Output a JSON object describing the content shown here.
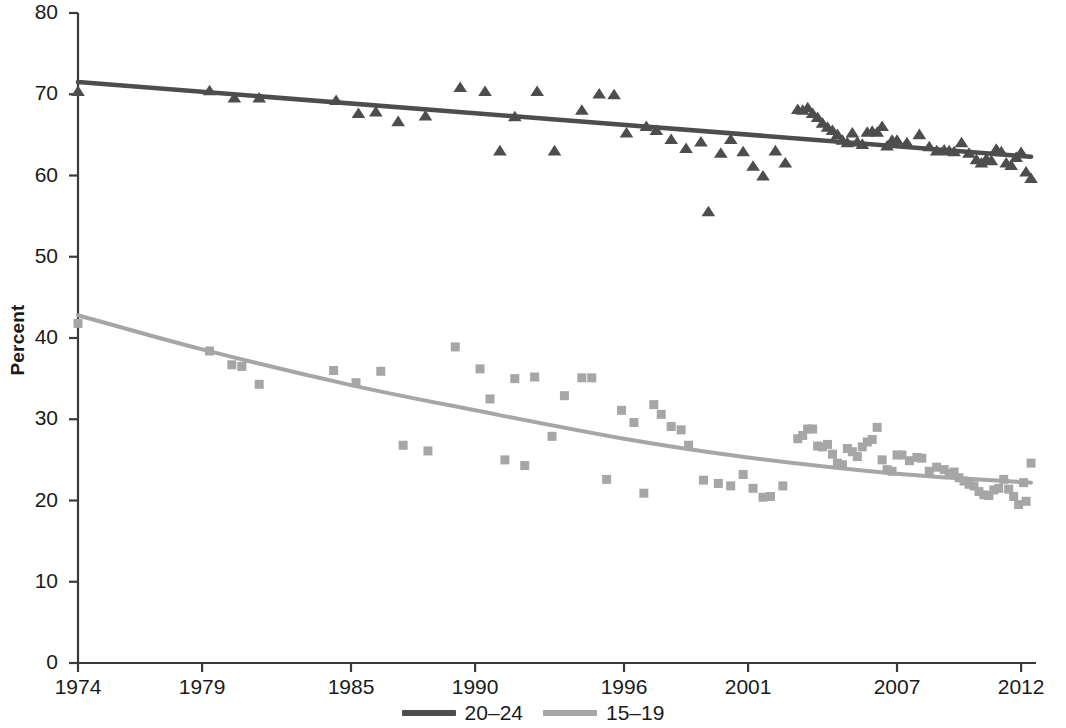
{
  "chart_data": {
    "type": "scatter",
    "title": "",
    "subtitle": "",
    "xlabel": "",
    "ylabel": "Percent",
    "xlim": [
      1974,
      2012.6
    ],
    "ylim": [
      0,
      80
    ],
    "grid": false,
    "legend_position": "bottom-center",
    "y_ticks": [
      0,
      10,
      20,
      30,
      40,
      50,
      60,
      70,
      80
    ],
    "y_tick_labels": [
      "0",
      "10",
      "20",
      "30",
      "40",
      "50",
      "60",
      "70",
      "80"
    ],
    "x_ticks": [
      1974,
      1979,
      1985,
      1990,
      1996,
      2001,
      2007,
      2012
    ],
    "x_tick_labels": [
      "1974",
      "1979",
      "1985",
      "1990",
      "1996",
      "2001",
      "2007",
      "2012"
    ],
    "series": [
      {
        "name": "20-24",
        "label": "20–24",
        "color": "#4d4d4d",
        "marker": "triangle",
        "trend": "linear",
        "trend_points": [
          [
            1974,
            71.5
          ],
          [
            2012.4,
            62.3
          ]
        ],
        "points": [
          [
            1974.0,
            70.3
          ],
          [
            1979.3,
            70.4
          ],
          [
            1980.3,
            69.5
          ],
          [
            1981.3,
            69.5
          ],
          [
            1984.4,
            69.2
          ],
          [
            1985.3,
            67.6
          ],
          [
            1986.0,
            67.8
          ],
          [
            1986.9,
            66.6
          ],
          [
            1988.0,
            67.3
          ],
          [
            1989.4,
            70.8
          ],
          [
            1990.4,
            70.3
          ],
          [
            1991.0,
            63.0
          ],
          [
            1991.6,
            67.2
          ],
          [
            1992.5,
            70.3
          ],
          [
            1993.2,
            63.0
          ],
          [
            1994.3,
            68.0
          ],
          [
            1995.0,
            70.0
          ],
          [
            1995.6,
            69.9
          ],
          [
            1996.1,
            65.2
          ],
          [
            1996.9,
            66.0
          ],
          [
            1997.3,
            65.5
          ],
          [
            1997.9,
            64.4
          ],
          [
            1998.5,
            63.3
          ],
          [
            1999.1,
            64.1
          ],
          [
            1999.4,
            55.5
          ],
          [
            1999.9,
            62.7
          ],
          [
            2000.3,
            64.4
          ],
          [
            2000.8,
            62.9
          ],
          [
            2001.2,
            61.1
          ],
          [
            2001.6,
            59.9
          ],
          [
            2002.1,
            63.0
          ],
          [
            2002.5,
            61.5
          ],
          [
            2003.0,
            68.1
          ],
          [
            2003.2,
            68.0
          ],
          [
            2003.4,
            68.3
          ],
          [
            2003.6,
            67.6
          ],
          [
            2003.8,
            67.1
          ],
          [
            2004.0,
            66.4
          ],
          [
            2004.2,
            65.9
          ],
          [
            2004.4,
            65.5
          ],
          [
            2004.6,
            65.0
          ],
          [
            2004.8,
            64.3
          ],
          [
            2005.0,
            64.0
          ],
          [
            2005.2,
            65.2
          ],
          [
            2005.4,
            64.1
          ],
          [
            2005.6,
            63.8
          ],
          [
            2005.8,
            65.3
          ],
          [
            2006.0,
            65.4
          ],
          [
            2006.2,
            65.3
          ],
          [
            2006.4,
            66.0
          ],
          [
            2006.6,
            63.6
          ],
          [
            2006.8,
            64.3
          ],
          [
            2007.0,
            64.3
          ],
          [
            2007.4,
            64.0
          ],
          [
            2007.9,
            65.0
          ],
          [
            2008.3,
            63.5
          ],
          [
            2008.6,
            63.0
          ],
          [
            2008.9,
            63.1
          ],
          [
            2009.1,
            63.0
          ],
          [
            2009.3,
            62.9
          ],
          [
            2009.6,
            64.0
          ],
          [
            2009.9,
            62.7
          ],
          [
            2010.2,
            61.9
          ],
          [
            2010.4,
            61.5
          ],
          [
            2010.6,
            62.0
          ],
          [
            2010.8,
            61.8
          ],
          [
            2011.0,
            63.2
          ],
          [
            2011.2,
            62.9
          ],
          [
            2011.4,
            61.5
          ],
          [
            2011.6,
            61.2
          ],
          [
            2011.8,
            62.2
          ],
          [
            2012.0,
            62.8
          ],
          [
            2012.2,
            60.4
          ],
          [
            2012.4,
            59.6
          ]
        ]
      },
      {
        "name": "15-19",
        "label": "15–19",
        "color": "#a6a6a6",
        "marker": "square",
        "trend": "curve",
        "trend_points": [
          [
            1974,
            42.8
          ],
          [
            1979,
            38.6
          ],
          [
            1985,
            34.2
          ],
          [
            1990,
            31.1
          ],
          [
            1996,
            27.6
          ],
          [
            2001,
            25.3
          ],
          [
            2007,
            23.3
          ],
          [
            2012.4,
            22.2
          ]
        ],
        "points": [
          [
            1974.0,
            41.8
          ],
          [
            1979.3,
            38.4
          ],
          [
            1980.2,
            36.7
          ],
          [
            1980.6,
            36.5
          ],
          [
            1981.3,
            34.3
          ],
          [
            1984.3,
            36.0
          ],
          [
            1985.2,
            34.5
          ],
          [
            1986.2,
            35.9
          ],
          [
            1987.1,
            26.8
          ],
          [
            1988.1,
            26.1
          ],
          [
            1989.2,
            38.9
          ],
          [
            1990.2,
            36.2
          ],
          [
            1990.6,
            32.5
          ],
          [
            1991.2,
            25.0
          ],
          [
            1991.6,
            35.0
          ],
          [
            1992.0,
            24.3
          ],
          [
            1992.4,
            35.2
          ],
          [
            1993.1,
            27.9
          ],
          [
            1993.6,
            32.9
          ],
          [
            1994.3,
            35.1
          ],
          [
            1994.7,
            35.1
          ],
          [
            1995.3,
            22.6
          ],
          [
            1995.9,
            31.1
          ],
          [
            1996.4,
            29.6
          ],
          [
            1996.8,
            20.9
          ],
          [
            1997.2,
            31.8
          ],
          [
            1997.5,
            30.6
          ],
          [
            1997.9,
            29.1
          ],
          [
            1998.3,
            28.7
          ],
          [
            1998.6,
            26.8
          ],
          [
            1999.2,
            22.5
          ],
          [
            1999.8,
            22.1
          ],
          [
            2000.3,
            21.8
          ],
          [
            2000.8,
            23.2
          ],
          [
            2001.2,
            21.5
          ],
          [
            2001.6,
            20.4
          ],
          [
            2001.9,
            20.5
          ],
          [
            2002.4,
            21.8
          ],
          [
            2003.0,
            27.6
          ],
          [
            2003.2,
            28.0
          ],
          [
            2003.4,
            28.8
          ],
          [
            2003.6,
            28.8
          ],
          [
            2003.8,
            26.7
          ],
          [
            2004.0,
            26.6
          ],
          [
            2004.2,
            26.9
          ],
          [
            2004.4,
            25.7
          ],
          [
            2004.6,
            24.6
          ],
          [
            2004.8,
            24.4
          ],
          [
            2005.0,
            26.4
          ],
          [
            2005.2,
            26.0
          ],
          [
            2005.4,
            25.4
          ],
          [
            2005.6,
            26.6
          ],
          [
            2005.8,
            27.2
          ],
          [
            2006.0,
            27.5
          ],
          [
            2006.2,
            29.0
          ],
          [
            2006.4,
            25.0
          ],
          [
            2006.6,
            23.8
          ],
          [
            2006.8,
            23.6
          ],
          [
            2007.0,
            25.6
          ],
          [
            2007.2,
            25.6
          ],
          [
            2007.5,
            24.9
          ],
          [
            2007.8,
            25.3
          ],
          [
            2008.0,
            25.2
          ],
          [
            2008.3,
            23.6
          ],
          [
            2008.6,
            24.1
          ],
          [
            2008.9,
            23.8
          ],
          [
            2009.1,
            23.3
          ],
          [
            2009.3,
            23.5
          ],
          [
            2009.5,
            22.8
          ],
          [
            2009.7,
            22.4
          ],
          [
            2009.9,
            22.0
          ],
          [
            2010.1,
            21.8
          ],
          [
            2010.3,
            21.1
          ],
          [
            2010.5,
            20.7
          ],
          [
            2010.7,
            20.6
          ],
          [
            2010.9,
            21.3
          ],
          [
            2011.1,
            21.5
          ],
          [
            2011.3,
            22.6
          ],
          [
            2011.5,
            21.4
          ],
          [
            2011.7,
            20.5
          ],
          [
            2011.9,
            19.5
          ],
          [
            2012.1,
            22.2
          ],
          [
            2012.2,
            19.9
          ],
          [
            2012.4,
            24.6
          ]
        ]
      }
    ]
  },
  "axis": {
    "y_axis_name": "percent-axis",
    "x_axis_name": "year-axis"
  },
  "legend": {
    "items": [
      {
        "label": "20–24",
        "color": "#4d4d4d"
      },
      {
        "label": "15–19",
        "color": "#a6a6a6"
      }
    ]
  }
}
